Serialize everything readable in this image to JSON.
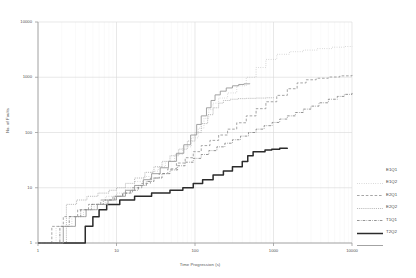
{
  "chart_data": {
    "type": "line",
    "title": "",
    "xlabel": "Time Progression (s)",
    "ylabel": "No. of Faults",
    "xscale": "log",
    "yscale": "log",
    "xlim": [
      1,
      10000
    ],
    "ylim": [
      1,
      10000
    ],
    "xticks": [
      "1",
      "10",
      "100",
      "1000",
      "10000"
    ],
    "xtick_values": [
      1,
      10,
      100,
      1000,
      10000
    ],
    "yticks": [
      "1",
      "10",
      "100",
      "1000",
      "10000"
    ],
    "ytick_values": [
      1,
      10,
      100,
      1000,
      10000
    ],
    "grid": true,
    "legend_position": "right",
    "series": [
      {
        "name": "E1Q1",
        "style": "fine-dotted",
        "color": "#b9b9b9",
        "points": [
          [
            1.0,
            1
          ],
          [
            1.6,
            1
          ],
          [
            1.7,
            2
          ],
          [
            2.6,
            2
          ],
          [
            2.7,
            3
          ],
          [
            3.6,
            3
          ],
          [
            3.8,
            4
          ],
          [
            5.0,
            4
          ],
          [
            5.2,
            5
          ],
          [
            7.0,
            5
          ],
          [
            7.3,
            7
          ],
          [
            10.0,
            8
          ],
          [
            13.0,
            10
          ],
          [
            17.0,
            13
          ],
          [
            22.0,
            16
          ],
          [
            28.0,
            20
          ],
          [
            34.0,
            24
          ],
          [
            42.0,
            30
          ],
          [
            55.0,
            40
          ],
          [
            70.0,
            55
          ],
          [
            90.0,
            80
          ],
          [
            110.0,
            120
          ],
          [
            130.0,
            180
          ],
          [
            150.0,
            260
          ],
          [
            170.0,
            340
          ],
          [
            200.0,
            420
          ],
          [
            260.0,
            520
          ],
          [
            340.0,
            700
          ],
          [
            450.0,
            1000
          ],
          [
            600.0,
            1500
          ],
          [
            800.0,
            2100
          ],
          [
            1100.0,
            2600
          ],
          [
            1600.0,
            2900
          ],
          [
            2400.0,
            3100
          ],
          [
            3600.0,
            3300
          ],
          [
            5500.0,
            3500
          ],
          [
            8000.0,
            3600
          ],
          [
            10000.0,
            3650
          ]
        ]
      },
      {
        "name": "E1Q2",
        "style": "dashed",
        "color": "#8f8f8f",
        "points": [
          [
            1.0,
            1
          ],
          [
            1.4,
            1
          ],
          [
            1.5,
            2
          ],
          [
            2.0,
            2
          ],
          [
            2.1,
            3
          ],
          [
            3.0,
            3
          ],
          [
            3.2,
            4
          ],
          [
            4.2,
            4
          ],
          [
            4.4,
            5
          ],
          [
            6.0,
            5
          ],
          [
            6.3,
            6
          ],
          [
            8.5,
            6
          ],
          [
            9.0,
            7
          ],
          [
            12.0,
            8
          ],
          [
            16.0,
            10
          ],
          [
            21.0,
            12
          ],
          [
            27.0,
            15
          ],
          [
            35.0,
            18
          ],
          [
            45.0,
            22
          ],
          [
            58.0,
            28
          ],
          [
            75.0,
            35
          ],
          [
            95.0,
            45
          ],
          [
            120.0,
            58
          ],
          [
            155.0,
            72
          ],
          [
            200.0,
            90
          ],
          [
            260.0,
            115
          ],
          [
            340.0,
            150
          ],
          [
            450.0,
            200
          ],
          [
            600.0,
            270
          ],
          [
            800.0,
            360
          ],
          [
            1100.0,
            470
          ],
          [
            1500.0,
            620
          ],
          [
            2000.0,
            790
          ],
          [
            2600.0,
            900
          ],
          [
            3500.0,
            960
          ],
          [
            5000.0,
            1010
          ],
          [
            7000.0,
            1060
          ],
          [
            10000.0,
            1100
          ]
        ]
      },
      {
        "name": "E2Q1",
        "style": "dense-dotted",
        "color": "#a8a8a8",
        "points": [
          [
            1.0,
            1
          ],
          [
            2.2,
            1
          ],
          [
            2.3,
            5
          ],
          [
            3.0,
            5
          ],
          [
            3.1,
            6
          ],
          [
            4.0,
            6
          ],
          [
            4.2,
            7
          ],
          [
            5.5,
            7
          ],
          [
            5.8,
            8
          ],
          [
            7.5,
            8
          ],
          [
            8.0,
            9
          ],
          [
            10.0,
            10
          ],
          [
            13.0,
            12
          ],
          [
            17.0,
            15
          ],
          [
            23.0,
            19
          ],
          [
            30.0,
            24
          ],
          [
            38.0,
            30
          ],
          [
            48.0,
            38
          ],
          [
            62.0,
            50
          ],
          [
            80.0,
            70
          ],
          [
            100.0,
            100
          ],
          [
            120.0,
            145
          ],
          [
            145.0,
            210
          ],
          [
            170.0,
            280
          ],
          [
            200.0,
            340
          ],
          [
            230.0,
            380
          ],
          [
            280.0,
            400
          ],
          [
            350.0,
            410
          ],
          [
            450.0,
            415
          ],
          [
            600.0,
            420
          ],
          [
            800.0,
            425
          ],
          [
            1000.0,
            430
          ]
        ]
      },
      {
        "name": "E2Q2",
        "style": "dash-dot",
        "color": "#7a7a7a",
        "points": [
          [
            1.0,
            1
          ],
          [
            1.8,
            1
          ],
          [
            1.9,
            2
          ],
          [
            2.4,
            2
          ],
          [
            2.5,
            3
          ],
          [
            3.3,
            3
          ],
          [
            3.5,
            4
          ],
          [
            4.6,
            4
          ],
          [
            4.8,
            5
          ],
          [
            6.4,
            5
          ],
          [
            6.8,
            6
          ],
          [
            9.0,
            6
          ],
          [
            9.5,
            7
          ],
          [
            12.0,
            8
          ],
          [
            15.0,
            9
          ],
          [
            19.0,
            11
          ],
          [
            24.0,
            13
          ],
          [
            30.0,
            15
          ],
          [
            38.0,
            18
          ],
          [
            48.0,
            21
          ],
          [
            60.0,
            25
          ],
          [
            75.0,
            29
          ],
          [
            95.0,
            34
          ],
          [
            120.0,
            40
          ],
          [
            150.0,
            47
          ],
          [
            190.0,
            55
          ],
          [
            240.0,
            64
          ],
          [
            300.0,
            74
          ],
          [
            380.0,
            86
          ],
          [
            480.0,
            100
          ],
          [
            600.0,
            115
          ],
          [
            760.0,
            133
          ],
          [
            960.0,
            152
          ],
          [
            1200.0,
            175
          ],
          [
            1500.0,
            200
          ],
          [
            1900.0,
            230
          ],
          [
            2400.0,
            265
          ],
          [
            3000.0,
            300
          ],
          [
            3800.0,
            345
          ],
          [
            5000.0,
            400
          ],
          [
            6500.0,
            450
          ],
          [
            8000.0,
            490
          ],
          [
            10000.0,
            520
          ]
        ]
      },
      {
        "name": "T1Q1",
        "style": "solid-thick",
        "color": "#2b2b2b",
        "points": [
          [
            1.0,
            1
          ],
          [
            3.5,
            1
          ],
          [
            4.0,
            2
          ],
          [
            5.0,
            3
          ],
          [
            6.0,
            4
          ],
          [
            7.5,
            5
          ],
          [
            9.0,
            5
          ],
          [
            11.0,
            6
          ],
          [
            14.0,
            6
          ],
          [
            17.0,
            7
          ],
          [
            22.0,
            7
          ],
          [
            28.0,
            8
          ],
          [
            40.0,
            8
          ],
          [
            48.0,
            9
          ],
          [
            60.0,
            9
          ],
          [
            70.0,
            10
          ],
          [
            85.0,
            10
          ],
          [
            95.0,
            12
          ],
          [
            110.0,
            12
          ],
          [
            125.0,
            14
          ],
          [
            150.0,
            14
          ],
          [
            170.0,
            17
          ],
          [
            200.0,
            17
          ],
          [
            230.0,
            20
          ],
          [
            270.0,
            20
          ],
          [
            300.0,
            24
          ],
          [
            360.0,
            24
          ],
          [
            400.0,
            30
          ],
          [
            470.0,
            38
          ],
          [
            550.0,
            45
          ],
          [
            650.0,
            45
          ],
          [
            780.0,
            48
          ],
          [
            950.0,
            50
          ],
          [
            1200.0,
            52
          ],
          [
            1500.0,
            53
          ]
        ]
      },
      {
        "name": "T2Q2",
        "style": "solid-gray",
        "color": "#999999",
        "points": [
          [
            1.0,
            1
          ],
          [
            2.0,
            1
          ],
          [
            2.1,
            2
          ],
          [
            2.8,
            2
          ],
          [
            3.0,
            3
          ],
          [
            3.9,
            3
          ],
          [
            4.1,
            4
          ],
          [
            5.4,
            4
          ],
          [
            5.7,
            5
          ],
          [
            7.4,
            5
          ],
          [
            7.8,
            6
          ],
          [
            10.0,
            7
          ],
          [
            13.0,
            9
          ],
          [
            17.0,
            11
          ],
          [
            22.0,
            14
          ],
          [
            28.0,
            18
          ],
          [
            36.0,
            23
          ],
          [
            46.0,
            30
          ],
          [
            58.0,
            42
          ],
          [
            72.0,
            60
          ],
          [
            88.0,
            90
          ],
          [
            105.0,
            140
          ],
          [
            120.0,
            200
          ],
          [
            140.0,
            280
          ],
          [
            160.0,
            380
          ],
          [
            180.0,
            480
          ],
          [
            210.0,
            560
          ],
          [
            250.0,
            640
          ],
          [
            300.0,
            700
          ],
          [
            360.0,
            740
          ],
          [
            420.0,
            760
          ],
          [
            500.0,
            770
          ]
        ]
      }
    ]
  }
}
